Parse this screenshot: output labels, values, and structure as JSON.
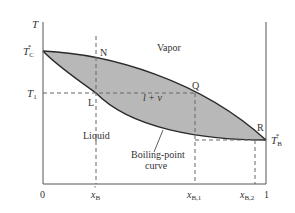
{
  "diagram": {
    "type": "phase-diagram",
    "axes": {
      "y_label": "T",
      "x_ticks": [
        {
          "main": "0",
          "sub": "",
          "prime": "",
          "x": 43
        },
        {
          "main": "x",
          "sub": "B",
          "prime": "′",
          "x": 96
        },
        {
          "main": "x",
          "sub": "B,1",
          "prime": "",
          "x": 195
        },
        {
          "main": "x",
          "sub": "B,2",
          "prime": "",
          "x": 255
        },
        {
          "main": "1",
          "sub": "",
          "prime": "",
          "x": 266
        }
      ],
      "y_ticks": [
        {
          "main": "T",
          "sub": "C",
          "sup": "*",
          "y": 51
        },
        {
          "main": "T",
          "sub": "1",
          "sup": "",
          "y": 93
        }
      ],
      "right_label": {
        "main": "T",
        "sub": "B",
        "sup": "*",
        "y": 140
      }
    },
    "points": [
      {
        "name": "N",
        "x": 96,
        "y": 57
      },
      {
        "name": "L",
        "x": 96,
        "y": 93
      },
      {
        "name": "Q",
        "x": 195,
        "y": 93
      },
      {
        "name": "R",
        "x": 255,
        "y": 140
      }
    ],
    "regions": {
      "vapor": "Vapor",
      "two_phase_l": "l",
      "two_phase_plus": "+",
      "two_phase_v": "v",
      "liquid": "Liquid"
    },
    "annotation": {
      "line1": "Boiling-point",
      "line2": "curve"
    },
    "colors": {
      "fill": "#b8b8b8",
      "curve": "#2a2a2a",
      "axis": "#555555",
      "dash": "#666666"
    }
  }
}
